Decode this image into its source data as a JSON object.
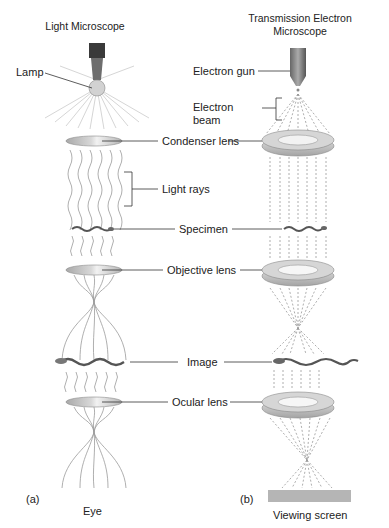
{
  "titles": {
    "left": "Light Microscope",
    "right_line1": "Transmission Electron",
    "right_line2": "Microscope"
  },
  "labels": {
    "lamp": "Lamp",
    "electron_gun": "Electron gun",
    "electron_beam_line1": "Electron",
    "electron_beam_line2": "beam",
    "condenser_lens": "Condenser lens",
    "light_rays": "Light rays",
    "specimen": "Specimen",
    "objective_lens": "Objective lens",
    "image": "Image",
    "ocular_lens": "Ocular lens",
    "eye": "Eye",
    "viewing_screen": "Viewing screen"
  },
  "panels": {
    "a": "(a)",
    "b": "(b)"
  },
  "colors": {
    "lens_light": "#c9c9c9",
    "lens_em": "#b8b8b8",
    "beam": "#999999",
    "screen": "#b5b5b5",
    "line": "#333333"
  }
}
